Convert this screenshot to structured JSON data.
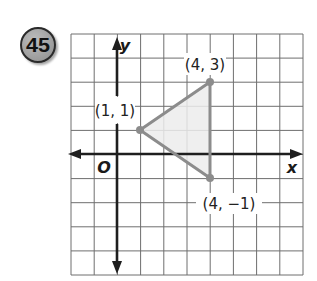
{
  "problem": {
    "number": "45",
    "badge_fill": "#a3a3a3",
    "badge_stroke": "#2a2a2a"
  },
  "graph": {
    "grid": {
      "x_min": -2,
      "x_max": 8,
      "y_min": -5,
      "y_max": 5,
      "line_color": "#6e6e6e",
      "axis_color": "#1e1e1e"
    },
    "axes": {
      "x_label": "x",
      "y_label": "y",
      "origin_label": "O"
    },
    "triangle": {
      "stroke": "#8c8c8c",
      "fill": "#ececec",
      "vertices": [
        {
          "x": 1,
          "y": 1,
          "label": "(1, 1)"
        },
        {
          "x": 4,
          "y": 3,
          "label": "(4, 3)"
        },
        {
          "x": 4,
          "y": -1,
          "label": "(4, −1)"
        }
      ]
    }
  }
}
